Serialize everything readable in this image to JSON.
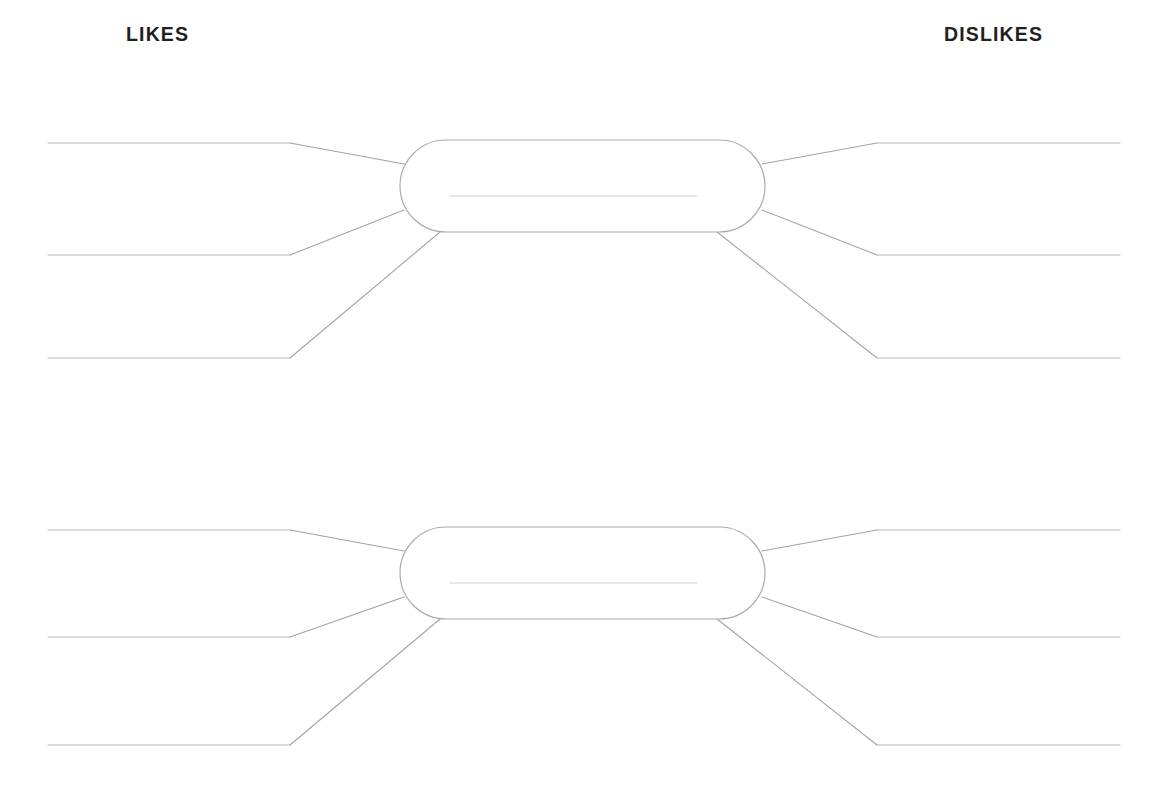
{
  "page": {
    "background_color": "#ffffff",
    "width": 1173,
    "height": 791
  },
  "headers": {
    "likes_label": "LIKES",
    "dislikes_label": "DISLIKES",
    "text_color": "#231f20"
  },
  "colors": {
    "write_line": "#b9b9bd",
    "connector_line": "#a2a2a8",
    "center_shape_stroke": "#a9a9af",
    "center_shape_fill": "#ffffff",
    "center_inner_line": "#cfcfd4"
  },
  "diagrams": [
    {
      "id": "organizer-1",
      "center": {
        "label": "",
        "shape": "rounded-rectangle",
        "x": 400,
        "y": 140,
        "width": 365,
        "height": 92,
        "radius": 46,
        "inner_write_line": {
          "x1": 450,
          "x2": 697,
          "y": 196,
          "value": ""
        }
      },
      "likes": [
        {
          "index": 1,
          "value": "",
          "line": {
            "x1": 48,
            "x2": 290,
            "y": 143
          },
          "connector": {
            "x1": 290,
            "y1": 143,
            "x2": 404,
            "y2": 164
          }
        },
        {
          "index": 2,
          "value": "",
          "line": {
            "x1": 48,
            "x2": 290,
            "y": 255
          },
          "connector": {
            "x1": 290,
            "y1": 255,
            "x2": 404,
            "y2": 210
          }
        },
        {
          "index": 3,
          "value": "",
          "line": {
            "x1": 48,
            "x2": 290,
            "y": 358
          },
          "connector": {
            "x1": 290,
            "y1": 358,
            "x2": 440,
            "y2": 232
          }
        }
      ],
      "dislikes": [
        {
          "index": 1,
          "value": "",
          "line": {
            "x1": 877,
            "x2": 1120,
            "y": 143
          },
          "connector": {
            "x1": 877,
            "y1": 143,
            "x2": 762,
            "y2": 164
          }
        },
        {
          "index": 2,
          "value": "",
          "line": {
            "x1": 877,
            "x2": 1120,
            "y": 255
          },
          "connector": {
            "x1": 877,
            "y1": 255,
            "x2": 762,
            "y2": 210
          }
        },
        {
          "index": 3,
          "value": "",
          "line": {
            "x1": 877,
            "x2": 1120,
            "y": 358
          },
          "connector": {
            "x1": 877,
            "y1": 358,
            "x2": 717,
            "y2": 232
          }
        }
      ]
    },
    {
      "id": "organizer-2",
      "center": {
        "label": "",
        "shape": "rounded-rectangle",
        "x": 400,
        "y": 527,
        "width": 365,
        "height": 92,
        "radius": 46,
        "inner_write_line": {
          "x1": 450,
          "x2": 697,
          "y": 583,
          "value": ""
        }
      },
      "likes": [
        {
          "index": 1,
          "value": "",
          "line": {
            "x1": 48,
            "x2": 290,
            "y": 530
          },
          "connector": {
            "x1": 290,
            "y1": 530,
            "x2": 404,
            "y2": 551
          }
        },
        {
          "index": 2,
          "value": "",
          "line": {
            "x1": 48,
            "x2": 290,
            "y": 637
          },
          "connector": {
            "x1": 290,
            "y1": 637,
            "x2": 404,
            "y2": 597
          }
        },
        {
          "index": 3,
          "value": "",
          "line": {
            "x1": 48,
            "x2": 290,
            "y": 745
          },
          "connector": {
            "x1": 290,
            "y1": 745,
            "x2": 440,
            "y2": 619
          }
        }
      ],
      "dislikes": [
        {
          "index": 1,
          "value": "",
          "line": {
            "x1": 877,
            "x2": 1120,
            "y": 530
          },
          "connector": {
            "x1": 877,
            "y1": 530,
            "x2": 762,
            "y2": 551
          }
        },
        {
          "index": 2,
          "value": "",
          "line": {
            "x1": 877,
            "x2": 1120,
            "y": 637
          },
          "connector": {
            "x1": 877,
            "y1": 637,
            "x2": 762,
            "y2": 597
          }
        },
        {
          "index": 3,
          "value": "",
          "line": {
            "x1": 877,
            "x2": 1120,
            "y": 745
          },
          "connector": {
            "x1": 877,
            "y1": 745,
            "x2": 717,
            "y2": 619
          }
        }
      ]
    }
  ]
}
